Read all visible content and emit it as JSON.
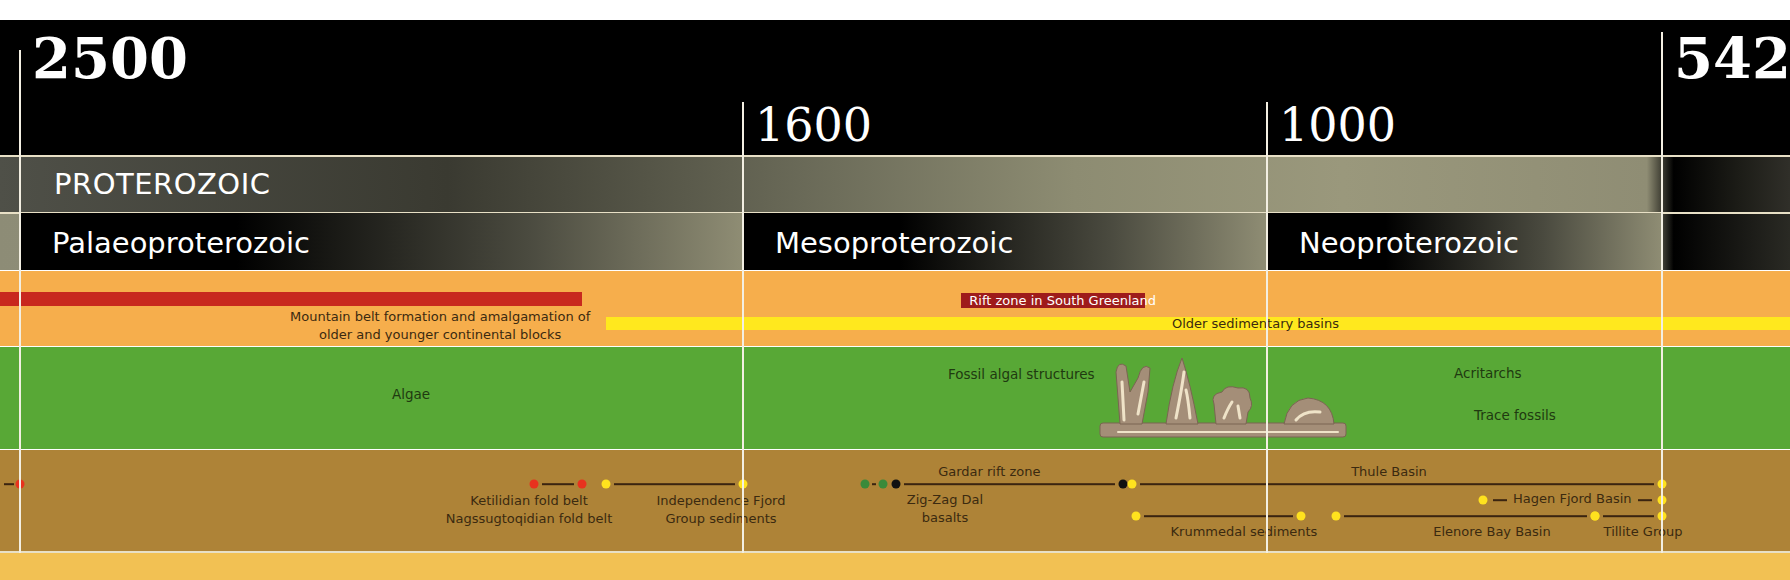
{
  "chart_data": {
    "type": "timeline",
    "title": "",
    "axis_unit": "million years ago",
    "range": [
      2500,
      542
    ],
    "ticks": [
      {
        "value": 2500,
        "label": "2500",
        "size": "big"
      },
      {
        "value": 1600,
        "label": "1600",
        "size": "mid"
      },
      {
        "value": 1000,
        "label": "1000",
        "size": "mid"
      },
      {
        "value": 542,
        "label": "542",
        "size": "big"
      }
    ],
    "eon": {
      "label": "PROTEROZOIC",
      "start": 2500,
      "end": 542
    },
    "eras": [
      {
        "label": "Palaeoproterozoic",
        "start": 2500,
        "end": 1600
      },
      {
        "label": "Mesoproterozoic",
        "start": 1600,
        "end": 1000
      },
      {
        "label": "Neoproterozoic",
        "start": 1000,
        "end": 542
      }
    ],
    "tectonics": [
      {
        "label": "Mountain belt formation and amalgamation of\nolder and younger continental blocks",
        "start": 2500,
        "end": 1800,
        "color": "#c8281e"
      },
      {
        "label": "Rift zone in South Greenland",
        "start": 1350,
        "end": 1140,
        "color": "#9e1b1b"
      },
      {
        "label": "Older sedimentary basins",
        "start": 1770,
        "end": 542,
        "color": "#ffe81e"
      }
    ],
    "life": [
      {
        "label": "Algae",
        "at": 2000
      },
      {
        "label": "Fossil algal structures",
        "at": 1400
      },
      {
        "label": "Acritarchs",
        "at": 800
      },
      {
        "label": "Trace fossils",
        "at": 800
      }
    ],
    "geology": [
      {
        "label": "Ketilidian fold belt\nNagssugtoqidian fold belt",
        "start": 1860,
        "end": 1800,
        "color": "#e8321e",
        "row": 1
      },
      {
        "label": "Independence Fjord\nGroup sediments",
        "start": 1770,
        "end": 1600,
        "color": "#ffe21e",
        "row": 1
      },
      {
        "label": "Zig-Zag Dal\nbasalts",
        "start": 1460,
        "end": 1440,
        "color": "#3a8a3a",
        "row": 1
      },
      {
        "label": "Gardar rift zone",
        "start": 1425,
        "end": 1165,
        "color": "#111111",
        "row": 1
      },
      {
        "label": "Thule Basin",
        "start": 1155,
        "end": 542,
        "color": "#ffe21e",
        "row": 1
      },
      {
        "label": "Hagen Fjord Basin",
        "start": 750,
        "end": 542,
        "color": "#ffe21e",
        "row": 2
      },
      {
        "label": "Krummedal sediments",
        "start": 1150,
        "end": 960,
        "color": "#ffe21e",
        "row": 3
      },
      {
        "label": "Elenore Bay Basin",
        "start": 920,
        "end": 620,
        "color": "#ffe21e",
        "row": 3
      },
      {
        "label": "Tillite Group",
        "start": 620,
        "end": 542,
        "color": "#ffe21e",
        "row": 3
      }
    ]
  },
  "colors": {
    "tectonic_band": "#f6ae4c",
    "life_band": "#58a836",
    "geology_band": "#ae8337",
    "bottom_band": "#f2c153"
  }
}
